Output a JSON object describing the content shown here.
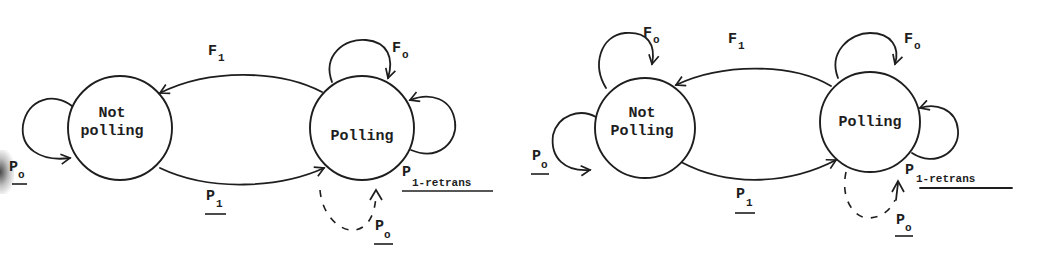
{
  "diagrams": [
    {
      "id": "left",
      "states": [
        {
          "name": "not_polling",
          "line1": "Not",
          "line2": "polling"
        },
        {
          "name": "polling",
          "line1": "Polling"
        }
      ],
      "transitions": {
        "f1": {
          "main": "F",
          "sub": "1",
          "from": "Polling",
          "to": "Not polling"
        },
        "p1": {
          "main": "P",
          "sub": "1",
          "from": "Not polling",
          "to": "Polling",
          "underlined": true
        },
        "po_not_polling_loop": {
          "main": "P",
          "sub": "o",
          "underlined": true
        },
        "fo_polling_loop": {
          "main": "F",
          "sub": "o"
        },
        "p1_retrans_loop": {
          "main": "P",
          "sub": "1-retrans",
          "underlined": true
        },
        "po_polling_dashed_loop": {
          "main": "P",
          "sub": "o",
          "underlined": true,
          "dashed": true
        }
      }
    },
    {
      "id": "right",
      "states": [
        {
          "name": "not_polling",
          "line1": "Not",
          "line2": "Polling"
        },
        {
          "name": "polling",
          "line1": "Polling"
        }
      ],
      "transitions": {
        "fo_not_polling_loop": {
          "main": "F",
          "sub": "o"
        },
        "po_not_polling_loop": {
          "main": "P",
          "sub": "o",
          "underlined": true
        },
        "f1": {
          "main": "F",
          "sub": "1",
          "from": "Polling",
          "to": "Not Polling"
        },
        "p1": {
          "main": "P",
          "sub": "1",
          "from": "Not Polling",
          "to": "Polling",
          "underlined": true
        },
        "fo_polling_loop": {
          "main": "F",
          "sub": "o"
        },
        "p1_retrans_loop": {
          "main": "P",
          "sub": "1-retrans",
          "underlined": true
        },
        "po_polling_dashed_loop": {
          "main": "P",
          "sub": "o",
          "underlined": true,
          "dashed": true
        }
      }
    }
  ],
  "colors": {
    "ink": "#1e1e1e",
    "paper": "#ffffff"
  }
}
